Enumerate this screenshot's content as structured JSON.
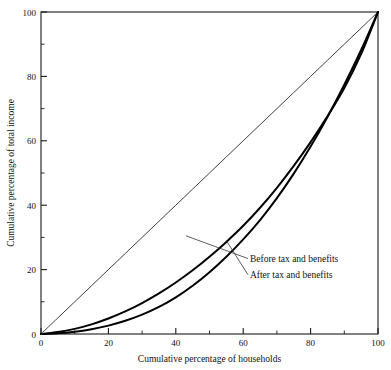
{
  "chart_data": {
    "type": "line",
    "title": "",
    "xlabel": "Cumulative percentage of households",
    "ylabel": "Cumulative percentage of total income",
    "xlim": [
      0,
      100
    ],
    "ylim": [
      0,
      100
    ],
    "grid": false,
    "legend_position": "inline-annotations",
    "x_ticks_major": [
      0,
      20,
      40,
      60,
      80,
      100
    ],
    "x_ticks_minor": [
      10,
      30,
      50,
      70,
      90
    ],
    "y_ticks_major": [
      0,
      20,
      40,
      60,
      80,
      100
    ],
    "y_ticks_minor": [
      10,
      30,
      50,
      70,
      90
    ],
    "x_tick_labels": [
      "0",
      "20",
      "40",
      "60",
      "80",
      "100"
    ],
    "y_tick_labels": [
      "0",
      "20",
      "40",
      "60",
      "80",
      "100"
    ],
    "x": [
      0,
      5,
      10,
      15,
      20,
      25,
      30,
      35,
      40,
      45,
      50,
      55,
      60,
      65,
      70,
      75,
      80,
      85,
      90,
      95,
      100
    ],
    "series": [
      {
        "name": "Line of equality",
        "label": "",
        "style": "thin",
        "values": [
          0,
          5,
          10,
          15,
          20,
          25,
          30,
          35,
          40,
          45,
          50,
          55,
          60,
          65,
          70,
          75,
          80,
          85,
          90,
          95,
          100
        ]
      },
      {
        "name": "After tax and benefits",
        "label": "After tax and benefits",
        "style": "thick",
        "values": [
          0,
          0.6,
          1.6,
          3.0,
          4.8,
          7.0,
          9.6,
          12.6,
          16.0,
          19.8,
          24.0,
          28.6,
          33.6,
          39.2,
          45.4,
          52.2,
          59.6,
          67.6,
          76.4,
          87.0,
          100
        ]
      },
      {
        "name": "Before tax and benefits",
        "label": "Before tax and benefits",
        "style": "thick",
        "values": [
          0,
          0.2,
          0.7,
          1.5,
          2.6,
          4.1,
          6.0,
          8.4,
          11.4,
          15.0,
          19.2,
          24.0,
          29.4,
          35.4,
          42.2,
          49.8,
          58.2,
          67.4,
          77.4,
          88.2,
          100
        ]
      }
    ],
    "annotations": [
      {
        "name": "before-tax-annotation",
        "text": "Before tax and benefits",
        "text_x": 62,
        "text_y": 22.5,
        "anchor_x": 43,
        "anchor_y": 30.5
      },
      {
        "name": "after-tax-annotation",
        "text": "After tax and benefits",
        "text_x": 62,
        "text_y": 17.5,
        "anchor_x": 55,
        "anchor_y": 29.0
      }
    ]
  }
}
